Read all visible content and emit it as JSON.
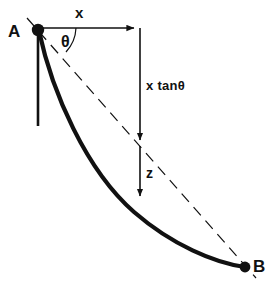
{
  "figure": {
    "type": "geometry-diagram",
    "background_color": "#ffffff",
    "stroke_color": "#111111",
    "points": {
      "A": {
        "label": "A",
        "x": 38,
        "y": 30,
        "marker": "filled-dot"
      },
      "B": {
        "label": "B",
        "x": 245,
        "y": 267,
        "marker": "filled-dot"
      }
    },
    "labels": {
      "point_a": "A",
      "point_b": "B",
      "horizontal_distance": "x",
      "angle": "θ",
      "vertical_drop": "x tanθ",
      "offset": "z"
    },
    "elements": [
      {
        "name": "curve-a-to-b",
        "kind": "thick-curve",
        "description": "concave-up arc from A to B"
      },
      {
        "name": "chord-a-to-b",
        "kind": "dashed-line",
        "description": "straight dashed chord from A through to B"
      },
      {
        "name": "vertical-reference-line",
        "kind": "solid-line",
        "description": "vertical line dropping from A"
      },
      {
        "name": "x-dimension-arrow",
        "kind": "arrow",
        "direction": "right"
      },
      {
        "name": "x-tan-theta-arrow",
        "kind": "arrow",
        "direction": "down"
      },
      {
        "name": "z-arrow",
        "kind": "arrow",
        "direction": "down"
      },
      {
        "name": "angle-arc",
        "kind": "arc"
      }
    ]
  }
}
